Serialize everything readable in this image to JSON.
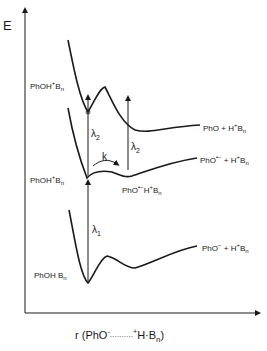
{
  "diagram": {
    "type": "potential-energy-curves",
    "y_axis_label": "E",
    "x_axis_label": {
      "prefix": "r (PhO",
      "sup1": "-",
      "dots": "··········",
      "sup2": "+",
      "mid": "H·B",
      "sub": "n",
      "suffix": ")"
    },
    "curves": [
      {
        "name": "upper",
        "left_label": {
          "base": "PhOH",
          "sup": "+",
          "tail": "B",
          "sub": "n"
        },
        "right_label": {
          "base": "PhO + H",
          "sup": "+",
          "tail": "B",
          "sub": "n"
        }
      },
      {
        "name": "middle",
        "left_label": {
          "base": "PhOH",
          "sup": "+",
          "tail": "B",
          "sub": "n"
        },
        "right_label": {
          "base": "PhO",
          "sup": "•−",
          "mid": " + H",
          "sup2": "+",
          "tail": "B",
          "sub": "n"
        },
        "well_label": {
          "base": "PhO",
          "sup": "•−",
          "mid": "H",
          "sup2": "+",
          "tail": "B",
          "sub": "n"
        }
      },
      {
        "name": "lower",
        "left_label": {
          "base": "PhOH B",
          "sub": "n"
        },
        "right_label": {
          "base": "PhO",
          "sup": "−",
          "mid": " + H",
          "sup2": "+",
          "tail": "B",
          "sub": "n"
        }
      }
    ],
    "transitions": [
      {
        "label": "λ",
        "sub": "1"
      },
      {
        "label": "λ",
        "sub": "2"
      },
      {
        "label": "λ",
        "sub": "2"
      }
    ],
    "rate_label": "k"
  }
}
